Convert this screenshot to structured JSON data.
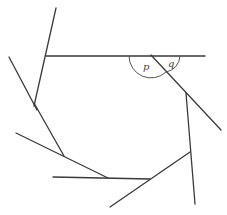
{
  "diagram": {
    "type": "geometry-polygon-exterior-angles",
    "labels": {
      "p": "p",
      "q": "q"
    },
    "line_color": "#3a3a3a"
  }
}
